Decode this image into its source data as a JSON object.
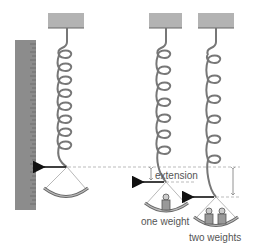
{
  "diagram": {
    "colors": {
      "ceiling": "#b3b3b3",
      "ruler": "#8c8c8c",
      "spring": "#777777",
      "arrow": "#111111",
      "dashed": "#aaaaaa",
      "weight": "#999999",
      "text": "#555555"
    },
    "labels": {
      "extension": "extension",
      "one_weight": "one weight",
      "two_weights": "two weights"
    },
    "springs": [
      {
        "name": "no weight",
        "weights": 0
      },
      {
        "name": "one weight",
        "weights": 1
      },
      {
        "name": "two weights",
        "weights": 2
      }
    ]
  }
}
